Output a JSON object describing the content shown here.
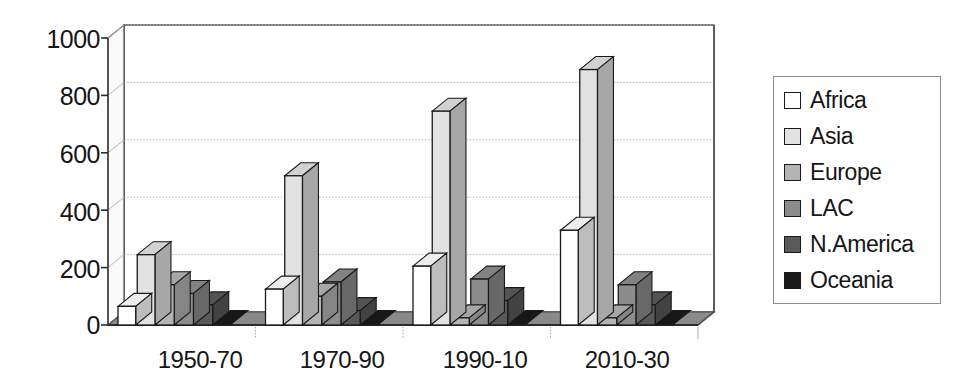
{
  "chart_data": {
    "type": "bar",
    "title": "",
    "subtitle": "",
    "xlabel": "",
    "ylabel": "",
    "categories": [
      "1950-70",
      "1970-90",
      "1990-10",
      "2010-30"
    ],
    "series": [
      {
        "name": "Africa",
        "color": "#ffffff",
        "values": [
          65,
          125,
          205,
          330
        ]
      },
      {
        "name": "Asia",
        "color": "#e2e2e2",
        "values": [
          245,
          520,
          745,
          890
        ]
      },
      {
        "name": "Europe",
        "color": "#b4b4b4",
        "values": [
          140,
          100,
          25,
          25
        ]
      },
      {
        "name": "LAC",
        "color": "#8c8c8c",
        "values": [
          110,
          150,
          160,
          140
        ]
      },
      {
        "name": "N.America",
        "color": "#595959",
        "values": [
          70,
          50,
          85,
          70
        ]
      },
      {
        "name": "Oceania",
        "color": "#1a1a1a",
        "values": [
          5,
          5,
          5,
          5
        ]
      }
    ],
    "ylim": [
      0,
      1000
    ],
    "yticks": [
      0,
      200,
      400,
      600,
      800,
      1000
    ],
    "ytick_labels": [
      "0",
      "200",
      "400",
      "600",
      "800",
      "1000"
    ],
    "grid": true,
    "grid_axis": "y",
    "legend_position": "right",
    "style": "3d-clustered-column-grayscale"
  },
  "legend": {
    "entries": [
      {
        "label": "Africa"
      },
      {
        "label": "Asia"
      },
      {
        "label": "Europe"
      },
      {
        "label": "LAC"
      },
      {
        "label": "N.America"
      },
      {
        "label": "Oceania"
      }
    ]
  },
  "colors": {
    "axis": "#4d4d4d",
    "gridline": "#b8b8b8",
    "floor": "#8a8a8a",
    "floor_front": "#6e6e6e",
    "bar_outline": "#1a1a1a",
    "text": "#161616",
    "legend_border": "#8e8e8e"
  }
}
